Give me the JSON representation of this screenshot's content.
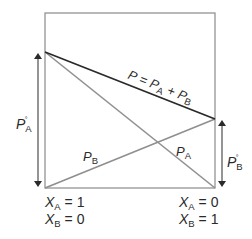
{
  "diagram": {
    "colors": {
      "frame": "#8a8a8a",
      "total_line": "#2a2a2a",
      "partial_lines": "#8f8f8f",
      "arrows": "#2a2a2a",
      "text": "#2a2a2a"
    },
    "lines": {
      "total": {
        "symbol": "P",
        "equals": "=",
        "term1": "P",
        "term1_sub": "A",
        "plus": "+",
        "term2": "P",
        "term2_sub": "B"
      },
      "partial_a": {
        "symbol": "P",
        "sub": "A"
      },
      "partial_b": {
        "symbol": "P",
        "sub": "B"
      }
    },
    "left_axis": {
      "symbol": "P",
      "sub": "A",
      "sup": "°"
    },
    "right_axis": {
      "symbol": "P",
      "sub": "B",
      "sup": "°"
    },
    "left_composition": {
      "line1": {
        "var": "X",
        "sub": "A",
        "value": "= 1"
      },
      "line2": {
        "var": "X",
        "sub": "B",
        "value": "= 0"
      }
    },
    "right_composition": {
      "line1": {
        "var": "X",
        "sub": "A",
        "value": "= 0"
      },
      "line2": {
        "var": "X",
        "sub": "B",
        "value": "= 1"
      }
    }
  }
}
